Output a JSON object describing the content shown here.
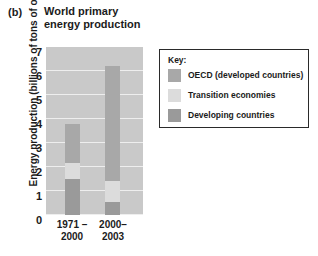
{
  "figure": {
    "panel_letter": "(b)",
    "title": "World primary\nenergy production"
  },
  "chart_data": {
    "type": "bar",
    "subtype": "stacked",
    "title": "World primary energy production",
    "xlabel": "",
    "ylabel": "Energy production (billions of tons of oil)",
    "ylim": [
      0,
      7
    ],
    "yticks": [
      0,
      1,
      2,
      3,
      4,
      5,
      6,
      7
    ],
    "ytick_labels": [
      "0",
      "1",
      "2",
      "3",
      "4",
      "5",
      "6",
      "7"
    ],
    "grid": true,
    "legend_position": "right",
    "categories": [
      "1971 –\n2000",
      "2000–\n2003"
    ],
    "category_labels_flat": [
      "1971 – 2000",
      "2000– 2003"
    ],
    "series": [
      {
        "name": "Developing countries",
        "color": "#9a9a9a",
        "values": [
          1.5,
          0.55
        ]
      },
      {
        "name": "Transition economies",
        "color": "#dcdcdc",
        "values": [
          0.65,
          0.85
        ]
      },
      {
        "name": "OECD (developed countries)",
        "color": "#a8a8a8",
        "values": [
          1.65,
          4.8
        ]
      }
    ],
    "stack_order_bottom_to_top": [
      "Developing countries",
      "Transition economies",
      "OECD (developed countries)"
    ],
    "totals": [
      3.8,
      6.2
    ],
    "plot_background": "#c9c9c9",
    "gridline_color": "#eeeeee"
  },
  "legend": {
    "title": "Key:",
    "items": [
      {
        "label": "OECD (developed countries)",
        "color": "#a8a8a8"
      },
      {
        "label": "Transition economies",
        "color": "#dcdcdc"
      },
      {
        "label": "Developing countries",
        "color": "#9a9a9a"
      }
    ]
  }
}
